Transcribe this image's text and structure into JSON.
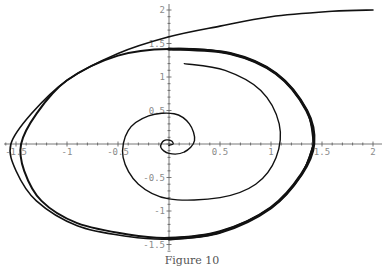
{
  "chart_data": {
    "type": "line",
    "title": "",
    "caption": "Figure 10",
    "xlabel": "",
    "ylabel": "",
    "xlim": [
      -1.6,
      2.1
    ],
    "ylim": [
      -1.6,
      2.1
    ],
    "grid": false,
    "axes_origin": [
      0,
      0
    ],
    "x_ticks": [
      -1.5,
      -1,
      -0.5,
      0.5,
      1,
      1.5,
      2
    ],
    "x_tick_labels": [
      "-1.5",
      "-1",
      "-0.5",
      "0.5",
      "1",
      "1.5",
      "2"
    ],
    "y_ticks": [
      -1.5,
      -1,
      -0.5,
      0.5,
      1,
      1.5,
      2
    ],
    "y_tick_labels": [
      "-1.5",
      "-1",
      "-0.5",
      "0.5",
      "1",
      "1.5",
      "2"
    ],
    "series": [
      {
        "name": "outer trajectory",
        "description": "Starts at (2,2), wraps around and converges onto the limit cycle",
        "points": [
          [
            2.0,
            2.0
          ],
          [
            1.6,
            1.98
          ],
          [
            1.0,
            1.9
          ],
          [
            0.5,
            1.76
          ],
          [
            0.0,
            1.6
          ],
          [
            -0.5,
            1.35
          ],
          [
            -1.0,
            0.95
          ],
          [
            -1.35,
            0.45
          ],
          [
            -1.55,
            0.0
          ],
          [
            -1.5,
            -0.4
          ],
          [
            -1.3,
            -0.85
          ],
          [
            -0.9,
            -1.22
          ],
          [
            -0.4,
            -1.38
          ],
          [
            0.0,
            -1.42
          ],
          [
            0.5,
            -1.32
          ],
          [
            1.0,
            -0.95
          ],
          [
            1.3,
            -0.45
          ],
          [
            1.42,
            0.0
          ],
          [
            1.35,
            0.5
          ],
          [
            1.05,
            1.05
          ],
          [
            0.6,
            1.35
          ],
          [
            0.0,
            1.42
          ],
          [
            -0.5,
            1.32
          ],
          [
            -1.0,
            0.95
          ],
          [
            -1.3,
            0.45
          ],
          [
            -1.45,
            0.0
          ],
          [
            -1.42,
            -0.4
          ],
          [
            -1.25,
            -0.85
          ],
          [
            -0.9,
            -1.18
          ],
          [
            -0.4,
            -1.35
          ],
          [
            0.0,
            -1.4
          ],
          [
            0.5,
            -1.3
          ],
          [
            1.0,
            -0.95
          ],
          [
            1.3,
            -0.45
          ],
          [
            1.42,
            0.0
          ]
        ]
      },
      {
        "name": "limit cycle",
        "description": "Thick closed orbit, approx. x in [-1.45, 1.42], y in [-1.42, 1.42]"
      },
      {
        "name": "inner trajectory",
        "description": "Starts at (0.15,1.2), spirals clockwise into the origin",
        "points": [
          [
            0.15,
            1.2
          ],
          [
            0.55,
            1.1
          ],
          [
            0.9,
            0.8
          ],
          [
            1.08,
            0.3
          ],
          [
            1.05,
            -0.2
          ],
          [
            0.85,
            -0.6
          ],
          [
            0.5,
            -0.8
          ],
          [
            0.0,
            -0.82
          ],
          [
            -0.3,
            -0.6
          ],
          [
            -0.45,
            -0.2
          ],
          [
            -0.4,
            0.2
          ],
          [
            -0.2,
            0.42
          ],
          [
            0.05,
            0.45
          ],
          [
            0.2,
            0.3
          ],
          [
            0.25,
            0.05
          ],
          [
            0.15,
            -0.12
          ],
          [
            0.0,
            -0.14
          ],
          [
            -0.08,
            -0.05
          ],
          [
            -0.05,
            0.05
          ],
          [
            0.02,
            0.05
          ],
          [
            0.04,
            0.0
          ],
          [
            0.0,
            -0.02
          ]
        ]
      }
    ]
  }
}
